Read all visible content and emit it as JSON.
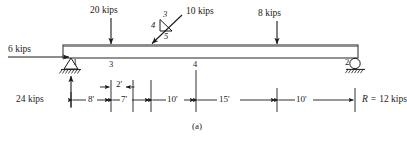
{
  "figure": {
    "caption": "(a)",
    "type": "beam-free-body-diagram"
  },
  "colors": {
    "ink": "#1a1a1a",
    "beam_fill": "#ffffff",
    "background": "#ffffff"
  },
  "beam": {
    "label": "beam",
    "left_x": 63,
    "right_x": 358,
    "top_y": 45,
    "bottom_y": 58
  },
  "loads": [
    {
      "name": "load-20-kips",
      "label": "20 kips",
      "magnitude": 20,
      "unit": "kips",
      "direction": "down",
      "at_x": 111
    },
    {
      "name": "load-10-kips",
      "label": "10 kips",
      "magnitude": 10,
      "unit": "kips",
      "direction": "inclined-down-left",
      "at_x": 151
    },
    {
      "name": "load-8-kips",
      "label": "8 kips",
      "magnitude": 8,
      "unit": "kips",
      "direction": "down",
      "at_x": 277
    },
    {
      "name": "load-6-kips",
      "label": "6 kips",
      "magnitude": 6,
      "unit": "kips",
      "direction": "right",
      "at_x": 71
    }
  ],
  "slope_triangle": {
    "name": "slope-triangle-3-4-5",
    "rise": "3",
    "run": "4",
    "hyp": "5"
  },
  "reactions": [
    {
      "name": "reaction-left",
      "label": "24 kips",
      "magnitude": 24,
      "unit": "kips",
      "direction": "up",
      "at_x": 71
    },
    {
      "name": "reaction-right",
      "label": "R",
      "equals": "=",
      "value": "12 kips",
      "magnitude": 12,
      "unit": "kips",
      "at_x": 355
    }
  ],
  "nodes": [
    {
      "name": "node-1",
      "label": "1",
      "x": 71
    },
    {
      "name": "node-3",
      "label": "3",
      "x": 112
    },
    {
      "name": "node-4",
      "label": "4",
      "x": 196
    },
    {
      "name": "node-2",
      "label": "2",
      "x": 355
    }
  ],
  "supports": [
    {
      "name": "pin-support-node-1",
      "type": "pin",
      "x": 71
    },
    {
      "name": "roller-support-node-2",
      "type": "roller",
      "x": 355
    }
  ],
  "dimensions": [
    {
      "name": "dim-8ft",
      "label": "8'",
      "value": 8,
      "unit": "ft",
      "from_x": 71,
      "to_x": 111
    },
    {
      "name": "dim-7ft",
      "label": "7'",
      "value": 7,
      "unit": "ft",
      "from_x": 111,
      "to_x": 151
    },
    {
      "name": "dim-2ft",
      "label": "2'",
      "value": 2,
      "unit": "ft",
      "from_x": 112,
      "to_x": 133
    },
    {
      "name": "dim-10ft-a",
      "label": "10'",
      "value": 10,
      "unit": "ft",
      "from_x": 151,
      "to_x": 196
    },
    {
      "name": "dim-15ft",
      "label": "15'",
      "value": 15,
      "unit": "ft",
      "from_x": 196,
      "to_x": 277
    },
    {
      "name": "dim-10ft-b",
      "label": "10'",
      "value": 10,
      "unit": "ft",
      "from_x": 277,
      "to_x": 355
    }
  ]
}
